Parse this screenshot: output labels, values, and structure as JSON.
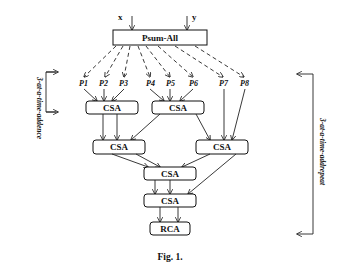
{
  "diagram": {
    "inputs": {
      "x": "x",
      "y": "y"
    },
    "top_block": "Psum-All",
    "partial_products": [
      "P1",
      "P2",
      "P3",
      "P4",
      "P5",
      "P6",
      "P7",
      "P8"
    ],
    "csa_label": "CSA",
    "final_block": "RCA",
    "left_bracket_label": "3-at-a-time-addence",
    "right_bracket_label": "3-at-a-time-addrepeat",
    "caption": "Fig. 1."
  },
  "colors": {
    "ink": "#111111",
    "background": "#ffffff"
  }
}
